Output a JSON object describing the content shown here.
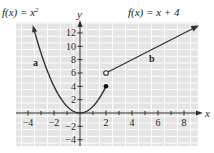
{
  "chart_data": {
    "type": "line",
    "title": "",
    "xlabel": "x",
    "ylabel": "y",
    "xlim": [
      -4.8,
      9
    ],
    "ylim": [
      -5,
      13.5
    ],
    "x_ticks": [
      -4,
      -2,
      2,
      4,
      6,
      8
    ],
    "y_ticks": [
      -4,
      -2,
      2,
      4,
      6,
      8,
      10,
      12
    ],
    "grid": true,
    "series": [
      {
        "name": "a",
        "equation_label": "f(x) = x²",
        "function": "x^2",
        "domain": [
          -3.6,
          2
        ],
        "endpoint": {
          "x": 2,
          "y": 4,
          "closed": true
        },
        "arrow_at": "left"
      },
      {
        "name": "b",
        "equation_label": "f(x) = x + 4",
        "function": "x + 4",
        "domain": [
          2,
          8.8
        ],
        "endpoint": {
          "x": 2,
          "y": 6,
          "closed": false
        },
        "arrow_at": "right"
      }
    ]
  },
  "labels": {
    "left_eq": "f(x) = x",
    "left_eq_sup": "2",
    "right_eq": "f(x) = x + 4",
    "curve_a": "a",
    "curve_b": "b",
    "x_axis": "x",
    "y_axis": "y"
  },
  "ticks": {
    "x": [
      "−4",
      "−2",
      "2",
      "4",
      "6",
      "8"
    ],
    "y": [
      "12",
      "10",
      "8",
      "6",
      "4",
      "2",
      "−2",
      "−4"
    ]
  },
  "colors": {
    "grid_bg": "#e4e4e4",
    "grid_line": "#ffffff",
    "curve": "#333333"
  }
}
